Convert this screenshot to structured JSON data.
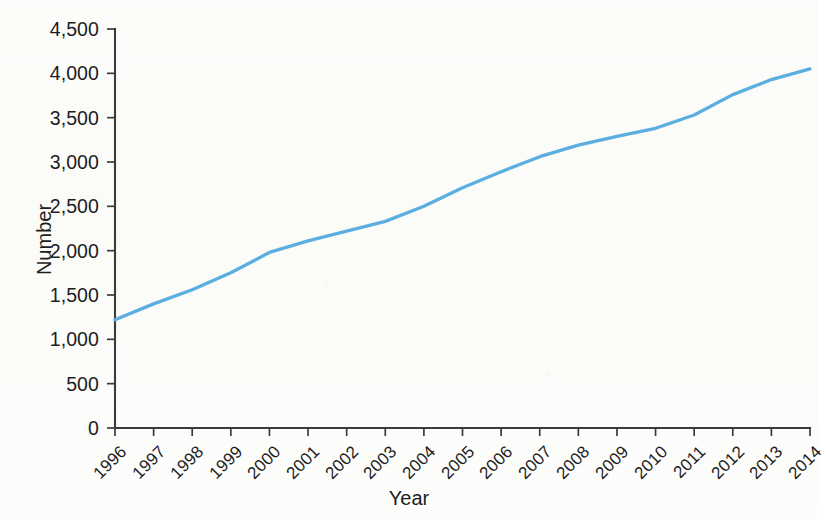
{
  "chart_data": {
    "type": "line",
    "title": "",
    "xlabel": "Year",
    "ylabel": "Number",
    "x": [
      1996,
      1997,
      1998,
      1999,
      2000,
      2001,
      2002,
      2003,
      2004,
      2005,
      2006,
      2007,
      2008,
      2009,
      2010,
      2011,
      2012,
      2013,
      2014
    ],
    "categories": [
      "1996",
      "1997",
      "1998",
      "1999",
      "2000",
      "2001",
      "2002",
      "2003",
      "2004",
      "2005",
      "2006",
      "2007",
      "2008",
      "2009",
      "2010",
      "2011",
      "2012",
      "2013",
      "2014"
    ],
    "values": [
      1220,
      1400,
      1560,
      1750,
      1980,
      2110,
      2220,
      2330,
      2500,
      2710,
      2890,
      3060,
      3190,
      3290,
      3380,
      3530,
      3760,
      3930,
      4050
    ],
    "series": [
      {
        "name": "Number",
        "color": "#5BAEE0",
        "values": [
          1220,
          1400,
          1560,
          1750,
          1980,
          2110,
          2220,
          2330,
          2500,
          2710,
          2890,
          3060,
          3190,
          3290,
          3380,
          3530,
          3760,
          3930,
          4050
        ]
      }
    ],
    "xlim": [
      1996,
      2014
    ],
    "ylim": [
      0,
      4500
    ],
    "ytick_values": [
      0,
      500,
      1000,
      1500,
      2000,
      2500,
      3000,
      3500,
      4000,
      4500
    ],
    "ytick_labels": [
      "0",
      "500",
      "1,000",
      "1,500",
      "2,000",
      "2,500",
      "3,000",
      "3,500",
      "4,000",
      "4,500"
    ],
    "xtick_labels": [
      "1996",
      "1997",
      "1998",
      "1999",
      "2000",
      "2001",
      "2002",
      "2003",
      "2004",
      "2005",
      "2006",
      "2007",
      "2008",
      "2009",
      "2010",
      "2011",
      "2012",
      "2013",
      "2014"
    ],
    "grid": false,
    "legend": "none",
    "xtick_label_rotation": -45,
    "line_color": "#5BAEE0",
    "axis_color": "#3b3b3b",
    "background_color": "#fdfdfb",
    "annotations": []
  },
  "axis": {
    "y_title": "Number",
    "x_title": "Year"
  }
}
